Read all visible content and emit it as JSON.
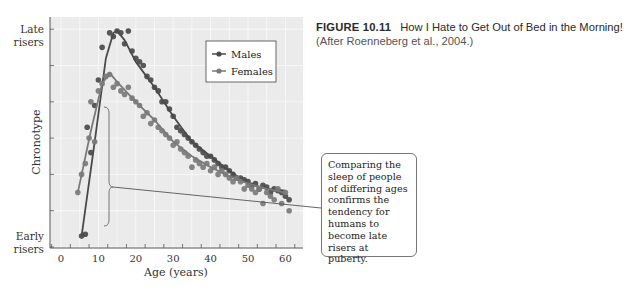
{
  "caption": {
    "figure_number": "FIGURE 10.11",
    "title": "How I Hate to Get Out of Bed in the Morning!",
    "credit": "(After Roenneberg et al., 2004.)"
  },
  "callout": {
    "text": "Comparing the sleep of people of differing ages confirms the tendency for humans to become late risers at puberty."
  },
  "chart_data": {
    "type": "scatter",
    "title": "",
    "xlabel": "Age (years)",
    "ylabel": "Chronotype",
    "y_top_label": "Late risers",
    "y_bottom_label": "Early risers",
    "xlim": [
      -3,
      65
    ],
    "ylim": [
      0,
      6.2
    ],
    "x_ticks": [
      0,
      10,
      20,
      30,
      40,
      50,
      60
    ],
    "grid": true,
    "legend_position": "upper right inside",
    "series": [
      {
        "name": "Males",
        "color": "#4a4a4a",
        "points": [
          [
            5.5,
            0.3
          ],
          [
            6.5,
            0.35
          ],
          [
            7,
            3.3
          ],
          [
            8,
            2.6
          ],
          [
            9,
            3.9
          ],
          [
            10,
            4.6
          ],
          [
            11,
            5.5
          ],
          [
            13,
            5.9
          ],
          [
            14,
            5.8
          ],
          [
            15,
            5.95
          ],
          [
            16,
            5.9
          ],
          [
            17,
            5.6
          ],
          [
            18,
            5.95
          ],
          [
            19,
            5.4
          ],
          [
            20,
            5.2
          ],
          [
            21,
            5.1
          ],
          [
            22,
            5.0
          ],
          [
            23,
            4.7
          ],
          [
            24,
            4.6
          ],
          [
            25,
            4.4
          ],
          [
            26,
            4.3
          ],
          [
            27,
            4.0
          ],
          [
            28,
            4.0
          ],
          [
            29,
            3.8
          ],
          [
            30,
            3.6
          ],
          [
            31,
            3.3
          ],
          [
            32,
            3.2
          ],
          [
            33,
            3.1
          ],
          [
            34,
            3.0
          ],
          [
            35,
            2.9
          ],
          [
            36,
            2.8
          ],
          [
            37,
            2.7
          ],
          [
            38,
            2.6
          ],
          [
            39,
            2.5
          ],
          [
            40,
            2.5
          ],
          [
            41,
            2.4
          ],
          [
            42,
            2.3
          ],
          [
            43,
            2.2
          ],
          [
            44,
            2.2
          ],
          [
            45,
            2.1
          ],
          [
            46,
            2.0
          ],
          [
            47,
            1.9
          ],
          [
            48,
            1.9
          ],
          [
            49,
            1.85
          ],
          [
            50,
            1.8
          ],
          [
            51,
            1.7
          ],
          [
            52,
            1.75
          ],
          [
            53,
            1.6
          ],
          [
            54,
            1.7
          ],
          [
            55,
            1.65
          ],
          [
            56,
            1.5
          ],
          [
            57,
            1.6
          ],
          [
            58,
            1.55
          ],
          [
            59,
            1.5
          ],
          [
            60,
            1.4
          ],
          [
            61,
            1.3
          ]
        ],
        "fit_curve": [
          [
            5.5,
            0.3
          ],
          [
            9,
            2.9
          ],
          [
            12,
            5.2
          ],
          [
            14,
            5.9
          ],
          [
            15,
            5.95
          ],
          [
            17,
            5.7
          ],
          [
            20,
            5.1
          ],
          [
            25,
            4.4
          ],
          [
            30,
            3.6
          ],
          [
            35,
            2.9
          ],
          [
            40,
            2.5
          ],
          [
            45,
            2.1
          ],
          [
            50,
            1.75
          ],
          [
            55,
            1.6
          ],
          [
            60,
            1.55
          ]
        ]
      },
      {
        "name": "Females",
        "color": "#7a7a7a",
        "points": [
          [
            4.5,
            1.5
          ],
          [
            5.5,
            2.0
          ],
          [
            6.5,
            2.3
          ],
          [
            7.5,
            3.0
          ],
          [
            8,
            4.0
          ],
          [
            9,
            2.9
          ],
          [
            10,
            4.3
          ],
          [
            11,
            4.5
          ],
          [
            12,
            4.7
          ],
          [
            13,
            4.75
          ],
          [
            14,
            4.4
          ],
          [
            15,
            4.5
          ],
          [
            16,
            4.3
          ],
          [
            17,
            4.2
          ],
          [
            18,
            4.4
          ],
          [
            19,
            4.1
          ],
          [
            20,
            4.0
          ],
          [
            21,
            3.9
          ],
          [
            22,
            3.6
          ],
          [
            23,
            3.7
          ],
          [
            24,
            3.4
          ],
          [
            25,
            3.5
          ],
          [
            26,
            3.3
          ],
          [
            27,
            3.2
          ],
          [
            28,
            3.1
          ],
          [
            29,
            3.0
          ],
          [
            30,
            2.8
          ],
          [
            31,
            2.9
          ],
          [
            32,
            2.7
          ],
          [
            33,
            2.6
          ],
          [
            34,
            2.5
          ],
          [
            35,
            2.2
          ],
          [
            36,
            2.4
          ],
          [
            37,
            2.3
          ],
          [
            38,
            2.2
          ],
          [
            39,
            2.3
          ],
          [
            40,
            2.1
          ],
          [
            41,
            2.2
          ],
          [
            42,
            2.0
          ],
          [
            43,
            2.1
          ],
          [
            44,
            2.0
          ],
          [
            45,
            1.9
          ],
          [
            46,
            1.8
          ],
          [
            47,
            1.9
          ],
          [
            48,
            1.8
          ],
          [
            49,
            1.6
          ],
          [
            50,
            1.7
          ],
          [
            51,
            1.6
          ],
          [
            52,
            1.5
          ],
          [
            53,
            1.6
          ],
          [
            54,
            1.2
          ],
          [
            55,
            1.5
          ],
          [
            56,
            1.4
          ],
          [
            57,
            1.3
          ],
          [
            58,
            1.6
          ],
          [
            59,
            1.2
          ],
          [
            60,
            1.5
          ],
          [
            61,
            1.0
          ]
        ],
        "fit_curve": [
          [
            4.5,
            1.5
          ],
          [
            8,
            3.2
          ],
          [
            11,
            4.5
          ],
          [
            13,
            4.8
          ],
          [
            15,
            4.55
          ],
          [
            20,
            4.0
          ],
          [
            25,
            3.5
          ],
          [
            30,
            2.9
          ],
          [
            35,
            2.5
          ],
          [
            40,
            2.2
          ],
          [
            45,
            1.95
          ],
          [
            50,
            1.75
          ],
          [
            55,
            1.6
          ],
          [
            60,
            1.5
          ]
        ]
      }
    ],
    "annotation": {
      "type": "brace",
      "x_age": 12.5,
      "y_range": [
        0.5,
        3.7
      ],
      "label_ref": "callout"
    }
  }
}
